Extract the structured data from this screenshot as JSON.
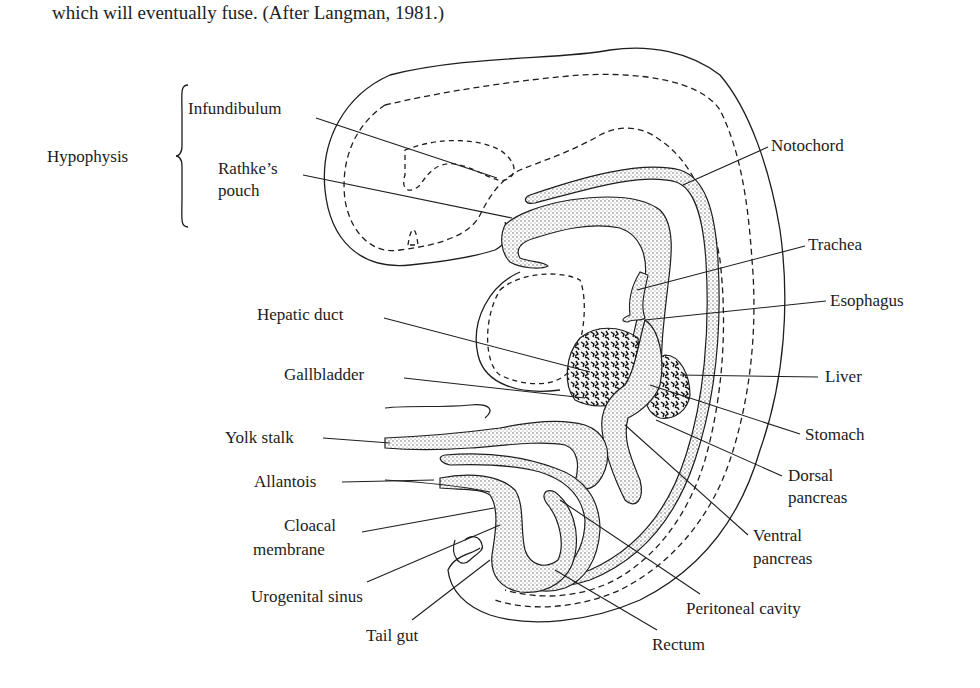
{
  "caption": {
    "text": "which will eventually fuse. (After Langman, 1981.)"
  },
  "figure": {
    "group_label": "Hypophysis",
    "group_members": [
      "Infundibulum",
      "Rathke's pouch"
    ],
    "labels": {
      "infundibulum": "Infundibulum",
      "rathkes_pouch_line1": "Rathke’s",
      "rathkes_pouch_line2": "pouch",
      "hypophysis": "Hypophysis",
      "notochord": "Notochord",
      "trachea": "Trachea",
      "esophagus": "Esophagus",
      "hepatic_duct": "Hepatic duct",
      "liver": "Liver",
      "gallbladder": "Gallbladder",
      "stomach": "Stomach",
      "yolk_stalk": "Yolk stalk",
      "dorsal_pancreas_line1": "Dorsal",
      "dorsal_pancreas_line2": "pancreas",
      "allantois": "Allantois",
      "ventral_pancreas_line1": "Ventral",
      "ventral_pancreas_line2": "pancreas",
      "cloacal_membrane_line1": "Cloacal",
      "cloacal_membrane_line2": "membrane",
      "urogenital_sinus": "Urogenital sinus",
      "peritoneal_cavity": "Peritoneal cavity",
      "tail_gut": "Tail gut",
      "rectum": "Rectum"
    },
    "colors": {
      "ink": "#1e1e1e",
      "stipple": "#b8b8b8",
      "background": "#ffffff"
    }
  }
}
